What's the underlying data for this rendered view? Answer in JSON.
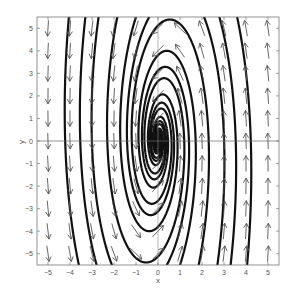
{
  "chart_data": {
    "type": "phase_portrait",
    "title": "",
    "xlabel": "x",
    "ylabel": "y",
    "xlim": [
      -5.5,
      5.5
    ],
    "ylim": [
      -5.5,
      5.5
    ],
    "xticks": [
      -5,
      -4,
      -3,
      -2,
      -1,
      0,
      1,
      2,
      3,
      4,
      5
    ],
    "yticks": [
      -5,
      -4,
      -3,
      -2,
      -1,
      0,
      1,
      2,
      3,
      4,
      5
    ],
    "xtick_labels": [
      "-5",
      "-4",
      "-3",
      "-2",
      "-1",
      "0",
      "1",
      "2",
      "3",
      "4",
      "5"
    ],
    "ytick_labels": [
      "-5",
      "-4",
      "-3",
      "-2",
      "-1",
      "0",
      "1",
      "2",
      "3",
      "4",
      "5"
    ],
    "grid": false,
    "axes_lines_through_origin": true,
    "vector_field": {
      "system": "x' = -0.25*y - 0.08*x, y' = 2.5*x - 0.25*y",
      "grid_x": [
        -5,
        -4,
        -3,
        -2,
        -1,
        0,
        1,
        2,
        3,
        4,
        5
      ],
      "grid_y": [
        -5,
        -4,
        -3,
        -2,
        -1,
        0,
        1,
        2,
        3,
        4,
        5
      ],
      "arrow_color": "#555555"
    },
    "trajectories": {
      "color": "#111111",
      "start_points": [
        [
          -4.05,
          5.5
        ],
        [
          -2.7,
          5.5
        ],
        [
          -1.85,
          5.5
        ],
        [
          -1.0,
          5.5
        ],
        [
          -0.4,
          5.5
        ],
        [
          4.05,
          -5.5
        ],
        [
          2.7,
          -5.5
        ],
        [
          1.85,
          -5.5
        ],
        [
          1.0,
          -5.5
        ],
        [
          0.4,
          -5.5
        ],
        [
          -3.3,
          5.5
        ],
        [
          3.3,
          -5.5
        ]
      ]
    }
  },
  "axes": {
    "xlabel": "x",
    "ylabel": "y"
  }
}
